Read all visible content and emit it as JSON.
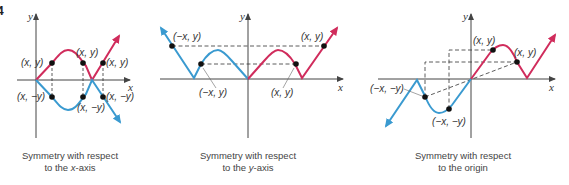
{
  "figure_number": "4",
  "colors": {
    "red": "#d02c5c",
    "blue": "#3a9ad0",
    "axis": "#444444",
    "point": "#111111"
  },
  "panels": [
    {
      "id": "x-axis-symmetry",
      "axis_labels": {
        "x": "x",
        "y": "y"
      },
      "point_labels": [
        "(x, y)",
        "(x, y)",
        "(x, y)",
        "(x, −y)",
        "(x, −y)",
        "(x, −y)"
      ],
      "caption_line1": "Symmetry with respect",
      "caption_line2_prefix": "to the ",
      "caption_line2_italic": "x",
      "caption_line2_suffix": "-axis"
    },
    {
      "id": "y-axis-symmetry",
      "axis_labels": {
        "x": "x",
        "y": "y"
      },
      "point_labels": [
        "(−x, y)",
        "(x, y)",
        "(−x, y)",
        "(x, y)"
      ],
      "caption_line1": "Symmetry with respect",
      "caption_line2_prefix": "to the ",
      "caption_line2_italic": "y",
      "caption_line2_suffix": "-axis"
    },
    {
      "id": "origin-symmetry",
      "axis_labels": {
        "x": "x",
        "y": "y"
      },
      "point_labels": [
        "(x, y)",
        "(x, y)",
        "(−x, −y)",
        "(−x, −y)"
      ],
      "caption_line1": "Symmetry with respect",
      "caption_line2": "to the origin"
    }
  ]
}
